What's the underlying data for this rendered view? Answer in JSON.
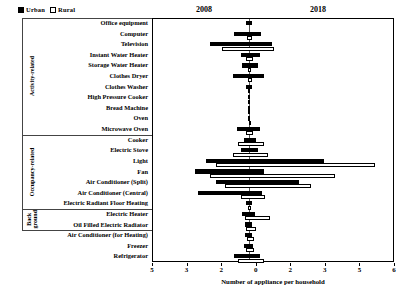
{
  "legend": {
    "items": [
      {
        "label": "Urban",
        "swatch": "filled-square-icon",
        "color": "#000000"
      },
      {
        "label": "Rural",
        "swatch": "hollow-square-icon",
        "color": "#ffffff"
      }
    ]
  },
  "headers": {
    "left_year": "2008",
    "right_year": "2018"
  },
  "groups": [
    {
      "name": "Activity-related",
      "rows": 11
    },
    {
      "name": "Occupancy-related",
      "rows": 7
    },
    {
      "name": "Back ground",
      "rows": 2
    }
  ],
  "axis": {
    "title": "Number of appliance per household",
    "ticks": [
      "5",
      "3",
      "2",
      "0",
      "2",
      "3",
      "5",
      "6"
    ],
    "zero_index": 3
  },
  "chart_data": {
    "type": "bar",
    "title": "Number of appliance per household",
    "subtitle": "2008 (left) vs 2018 (right), Urban vs Rural",
    "orientation": "horizontal-diverging",
    "xlabel": "Number of appliance per household",
    "ylabel": "",
    "xlim": [
      -3.2,
      6.0
    ],
    "tick_labels": [
      "5",
      "3",
      "2",
      "0",
      "2",
      "3",
      "5",
      "6"
    ],
    "grid": false,
    "legend": [
      "Urban",
      "Rural"
    ],
    "legend_position": "top-left",
    "categories": [
      "Office equipment",
      "Computer",
      "Television",
      "Instant Water Heater",
      "Storage Water Heater",
      "Clothes Dryer",
      "Clothes Washer",
      "High Pressure Cooker",
      "Bread Machine",
      "Oven",
      "Microwave Oven",
      "Cooker",
      "Electric Stove",
      "Light",
      "Fan",
      "Air Conditioner (Split)",
      "Air Conditioner (Central)",
      "Electric Radiant Floor Heating",
      "Electric Heater",
      "Oil Filled Electric Radiator",
      "Air Conditioner (for Heating)",
      "Freezer",
      "Refrigerator"
    ],
    "series": [
      {
        "name": "Urban",
        "note": "black bar; negative = 2008 side, positive = 2018 side",
        "left_2008": [
          0.1,
          0.55,
          1.45,
          0.3,
          0.25,
          0.6,
          0.1,
          0.05,
          0.05,
          0.02,
          0.45,
          0.2,
          0.3,
          1.6,
          2.0,
          1.25,
          1.9,
          0.1,
          0.25,
          0.15,
          0.15,
          0.2,
          0.55
        ],
        "right_2018": [
          0.12,
          0.45,
          0.85,
          0.4,
          0.35,
          0.55,
          0.12,
          0.05,
          0.05,
          0.02,
          0.4,
          0.25,
          0.35,
          2.8,
          0.55,
          1.85,
          0.5,
          0.1,
          0.22,
          0.1,
          0.1,
          0.15,
          0.4
        ]
      },
      {
        "name": "Rural",
        "note": "white/outlined bar; negative = 2008 side, positive = 2018 side",
        "left_2008": [
          0.0,
          0.08,
          1.0,
          0.12,
          0.05,
          0.05,
          0.02,
          0.02,
          0.02,
          0.01,
          0.1,
          0.4,
          0.6,
          1.25,
          1.45,
          0.9,
          0.3,
          0.05,
          0.15,
          0.1,
          0.08,
          0.1,
          0.4
        ],
        "right_2018": [
          0.0,
          0.1,
          0.95,
          0.15,
          0.08,
          0.1,
          0.05,
          0.02,
          0.02,
          0.01,
          0.15,
          0.55,
          0.7,
          4.7,
          3.2,
          2.3,
          0.6,
          0.08,
          0.8,
          0.25,
          0.2,
          0.18,
          0.55
        ]
      }
    ]
  }
}
